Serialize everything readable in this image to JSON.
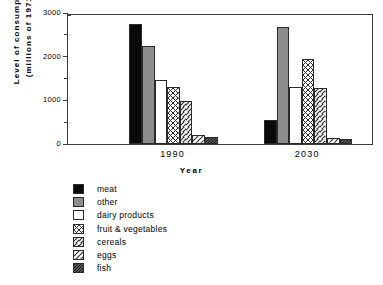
{
  "chart_data": {
    "type": "bar",
    "title": "",
    "xlabel": "Year",
    "ylabel": "Level of consumption (millions of 1971$)",
    "ylabel_line1": "Level  of  consumption",
    "ylabel_line2": "(millions  of  1971$)",
    "categories": [
      "1990",
      "2030"
    ],
    "ylim": [
      0,
      3000
    ],
    "yticks": [
      0,
      1000,
      2000,
      3000
    ],
    "ytick_labels": [
      "0",
      "1000",
      "2000",
      "3000"
    ],
    "yminor_step": 500,
    "grid": false,
    "legend_position": "below-left",
    "series": [
      {
        "name": "meat",
        "pattern": "solid-black",
        "color": "#0a0a0a",
        "values": [
          2750,
          550
        ]
      },
      {
        "name": "other",
        "pattern": "solid-gray",
        "color": "#8d8d8d",
        "values": [
          2250,
          2680
        ]
      },
      {
        "name": "dairy products",
        "pattern": "white",
        "color": "#ffffff",
        "values": [
          1470,
          1300
        ]
      },
      {
        "name": "fruit & vegetables",
        "pattern": "cross-hatch",
        "color": "#ffffff",
        "values": [
          1300,
          1950
        ]
      },
      {
        "name": "cereals",
        "pattern": "diagonal-fwd",
        "color": "#ffffff",
        "values": [
          980,
          1280
        ]
      },
      {
        "name": "eggs",
        "pattern": "diagonal-back",
        "color": "#ffffff",
        "values": [
          200,
          130
        ]
      },
      {
        "name": "fish",
        "pattern": "stipple-dark",
        "color": "#4a4a4a",
        "values": [
          170,
          110
        ]
      }
    ]
  }
}
